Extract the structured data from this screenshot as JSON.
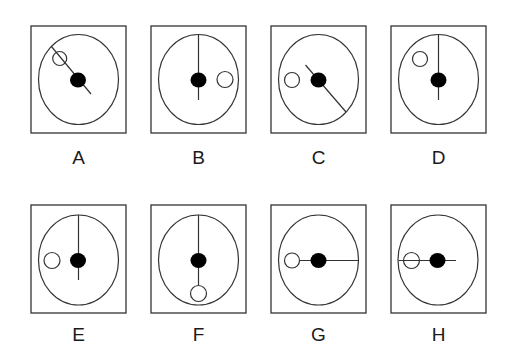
{
  "figure": {
    "stroke_color": "#333333",
    "fill_color": "#000000",
    "background": "#ffffff"
  },
  "panels": [
    {
      "label": "A",
      "box": [
        31,
        26,
        95,
        107
      ],
      "ellipse": [
        78.5,
        79.5,
        40,
        45
      ],
      "dot": [
        78,
        80
      ],
      "open_circle": [
        59.7,
        58.5,
        7
      ],
      "line": [
        51,
        46,
        91,
        94
      ]
    },
    {
      "label": "B",
      "box": [
        151,
        26,
        95,
        107
      ],
      "ellipse": [
        198.5,
        79.5,
        40,
        45
      ],
      "dot": [
        198.5,
        80
      ],
      "open_circle": [
        225,
        79.5,
        8
      ],
      "line": [
        198.5,
        34.5,
        198.5,
        100
      ]
    },
    {
      "label": "C",
      "box": [
        271,
        26,
        95,
        107
      ],
      "ellipse": [
        318.5,
        79.5,
        40,
        45
      ],
      "dot": [
        318.5,
        80
      ],
      "open_circle": [
        292,
        80,
        7.5
      ],
      "line": [
        305.5,
        65,
        346,
        112
      ]
    },
    {
      "label": "D",
      "box": [
        391,
        26,
        95,
        107
      ],
      "ellipse": [
        438.5,
        79.5,
        40,
        45
      ],
      "dot": [
        438.5,
        80
      ],
      "open_circle": [
        420,
        59,
        7.5
      ],
      "line": [
        438.5,
        34.5,
        438.5,
        100
      ]
    },
    {
      "label": "E",
      "box": [
        31,
        205,
        95,
        108
      ],
      "ellipse": [
        78.5,
        260,
        40,
        45
      ],
      "dot": [
        78,
        260.5
      ],
      "open_circle": [
        52,
        260.5,
        8
      ],
      "line": [
        78.5,
        215,
        78.5,
        280
      ]
    },
    {
      "label": "F",
      "box": [
        151,
        205,
        95,
        108
      ],
      "ellipse": [
        198.5,
        260,
        40,
        45
      ],
      "dot": [
        198.5,
        260.5
      ],
      "open_circle": [
        198.5,
        293.5,
        8
      ],
      "line": [
        198.5,
        215,
        198.5,
        285
      ]
    },
    {
      "label": "G",
      "box": [
        271,
        205,
        95,
        108
      ],
      "ellipse": [
        318.5,
        260,
        40,
        45
      ],
      "dot": [
        318.5,
        260.5
      ],
      "open_circle": [
        292,
        260.5,
        7.5
      ],
      "line": [
        299.5,
        260.5,
        358.5,
        260.5
      ]
    },
    {
      "label": "H",
      "box": [
        391,
        205,
        95,
        108
      ],
      "ellipse": [
        438,
        260,
        40,
        45
      ],
      "dot": [
        437.5,
        260.5
      ],
      "open_circle": [
        411.5,
        260.5,
        8
      ],
      "line": [
        398.5,
        260.5,
        456,
        260.5
      ]
    }
  ],
  "labels": {
    "row1_y": 158,
    "row2_y": 335
  }
}
